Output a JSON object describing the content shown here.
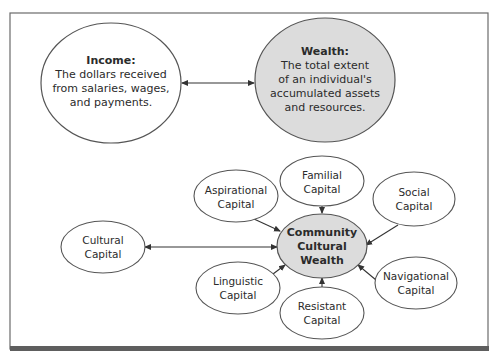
{
  "diagram": {
    "colors": {
      "frame": "#6b6b6b",
      "frame_bottom": "#5e5e5e",
      "node_stroke": "#555555",
      "node_fill": "#ffffff",
      "highlight_fill": "#dcdcdc",
      "text": "#2b2b2b",
      "arrow": "#333333"
    },
    "income": {
      "title": "Income:",
      "lines": [
        "The dollars received",
        "from salaries, wages,",
        "and payments."
      ]
    },
    "wealth": {
      "title": "Wealth:",
      "lines": [
        "The total extent",
        "of an individual's",
        "accumulated assets",
        "and resources."
      ]
    },
    "center": {
      "lines": [
        "Community",
        "Cultural",
        "Wealth"
      ]
    },
    "capitals": {
      "familial": [
        "Familial",
        "Capital"
      ],
      "aspirational": [
        "Aspirational",
        "Capital"
      ],
      "social": [
        "Social",
        "Capital"
      ],
      "cultural": [
        "Cultural",
        "Capital"
      ],
      "linguistic": [
        "Linguistic",
        "Capital"
      ],
      "navigational": [
        "Navigational",
        "Capital"
      ],
      "resistant": [
        "Resistant",
        "Capital"
      ]
    },
    "relationships": [
      {
        "from": "Income",
        "to": "Wealth",
        "type": "bidirectional"
      },
      {
        "from": "Cultural Capital",
        "to": "Community Cultural Wealth",
        "type": "bidirectional"
      },
      {
        "from": "Familial Capital",
        "to": "Community Cultural Wealth",
        "type": "directed"
      },
      {
        "from": "Aspirational Capital",
        "to": "Community Cultural Wealth",
        "type": "directed"
      },
      {
        "from": "Social Capital",
        "to": "Community Cultural Wealth",
        "type": "directed"
      },
      {
        "from": "Linguistic Capital",
        "to": "Community Cultural Wealth",
        "type": "directed"
      },
      {
        "from": "Navigational Capital",
        "to": "Community Cultural Wealth",
        "type": "directed"
      },
      {
        "from": "Resistant Capital",
        "to": "Community Cultural Wealth",
        "type": "directed"
      }
    ]
  }
}
